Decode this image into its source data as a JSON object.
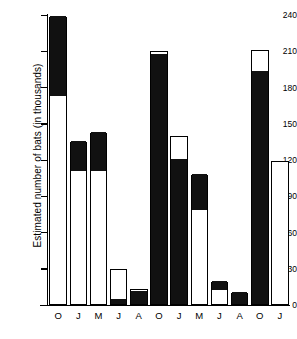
{
  "chart_data": {
    "type": "bar",
    "title": "",
    "subtitle": "",
    "xlabel": "",
    "ylabel": "Estimated number of bats (in thousands)",
    "ylim": [
      0,
      240
    ],
    "yticks": [
      0,
      30,
      60,
      90,
      120,
      150,
      180,
      210,
      240
    ],
    "ytick_labels": [
      "0",
      "30",
      "60",
      "90",
      "120",
      "150",
      "180",
      "210",
      "240"
    ],
    "grid": false,
    "legend": "none",
    "stacked": true,
    "categories": [
      "O",
      "J",
      "M",
      "J",
      "A",
      "O",
      "J",
      "M",
      "J",
      "A",
      "O",
      "J"
    ],
    "totals": [
      238,
      135,
      142,
      30,
      13,
      210,
      140,
      108,
      19,
      10,
      211,
      119
    ],
    "series": [
      {
        "name": "white-segment",
        "color": "#ffffff",
        "values": [
          172,
          110,
          110,
          26,
          2,
          3,
          20,
          30,
          12,
          0,
          18,
          119
        ]
      },
      {
        "name": "black-segment",
        "color": "#111111",
        "values": [
          66,
          25,
          32,
          4,
          11,
          207,
          120,
          78,
          7,
          10,
          193,
          0
        ]
      }
    ],
    "bars": [
      {
        "label": "O",
        "total": 238,
        "black_top": 238,
        "black_bottom": 172,
        "note": "black from 172 to 238, white below"
      },
      {
        "label": "J",
        "total": 135,
        "black_top": 135,
        "black_bottom": 110,
        "note": "black from 110 to 135, white below"
      },
      {
        "label": "M",
        "total": 142,
        "black_top": 142,
        "black_bottom": 110,
        "note": "black from 110 to 142, white below"
      },
      {
        "label": "J",
        "total": 30,
        "black_top": 4,
        "black_bottom": 0,
        "note": "black base 0 to 4, white above to 30"
      },
      {
        "label": "A",
        "total": 13,
        "black_top": 11,
        "black_bottom": 0,
        "note": "black base 0 to 11, thin white to 13"
      },
      {
        "label": "O",
        "total": 210,
        "black_top": 207,
        "black_bottom": 0,
        "note": "black 0 to 207, thin white sliver to 210"
      },
      {
        "label": "J",
        "total": 140,
        "black_top": 120,
        "black_bottom": 0,
        "note": "black 0 to 120, white 120 to 140"
      },
      {
        "label": "M",
        "total": 108,
        "black_top": 108,
        "black_bottom": 78,
        "note": "black 78 to 108, white below"
      },
      {
        "label": "J",
        "total": 19,
        "black_top": 19,
        "black_bottom": 12,
        "note": "black 12 to 19, white below"
      },
      {
        "label": "A",
        "total": 10,
        "black_top": 10,
        "black_bottom": 0,
        "note": "all black 0 to 10"
      },
      {
        "label": "O",
        "total": 211,
        "black_top": 193,
        "black_bottom": 0,
        "note": "black 0 to 193, white 193 to 211"
      },
      {
        "label": "J",
        "total": 119,
        "black_top": 0,
        "black_bottom": 0,
        "note": "all white 0 to 119"
      }
    ]
  }
}
